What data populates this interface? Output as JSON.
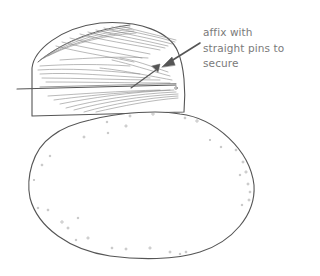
{
  "illustration": {
    "subject": "feather-on-half-dome-above-oval-pie-crust",
    "line_color": "#555555",
    "hatch_color": "#8a8a8a",
    "speckle_color": "#9a9a9a"
  },
  "annotation": {
    "lines": [
      "affix with",
      "straight pins to",
      "secure"
    ],
    "color": "#7a7a7a"
  }
}
